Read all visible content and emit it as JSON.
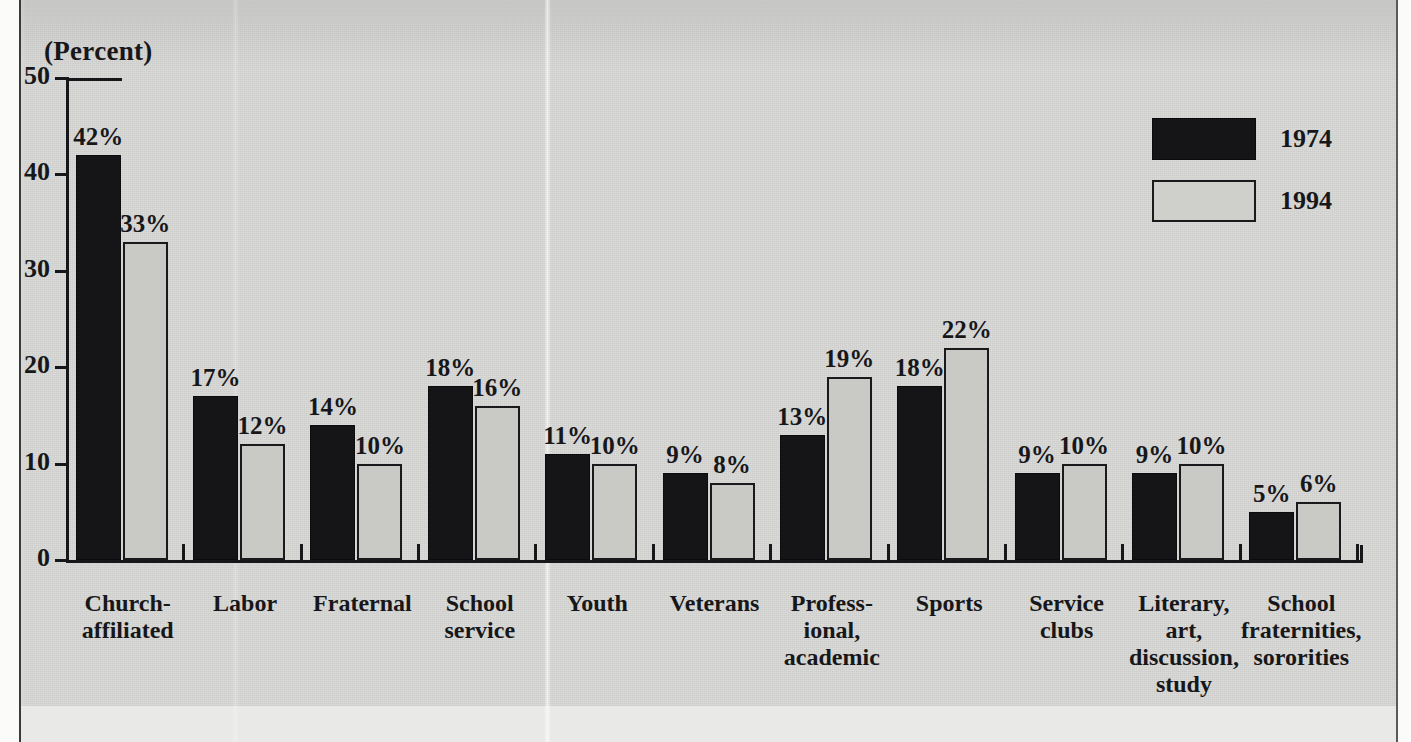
{
  "figure": {
    "axis_unit_label": "(Percent)",
    "cut_off_top_title": "",
    "left_frame_color": "#3a3a3a",
    "background_color": "#d9d9d7"
  },
  "legend": {
    "position": "top-right",
    "entries": [
      {
        "label": "1974",
        "swatch": "filled-black",
        "color": "#151517"
      },
      {
        "label": "1994",
        "swatch": "outlined-light",
        "color": "#c9c9c6"
      }
    ]
  },
  "axis": {
    "y_ticks": [
      "50",
      "40",
      "30",
      "20",
      "10",
      "0"
    ],
    "y_values": [
      50,
      40,
      30,
      20,
      10,
      0
    ]
  },
  "chart_data": {
    "type": "bar",
    "title": "(Percent)",
    "xlabel": "",
    "ylabel": "(Percent)",
    "ylim": [
      0,
      50
    ],
    "grid": false,
    "legend_position": "top-right",
    "categories": [
      "Church-\naffiliated",
      "Labor",
      "Fraternal",
      "School\nservice",
      "Youth",
      "Veterans",
      "Profess-\nional,\nacademic",
      "Sports",
      "Service\nclubs",
      "Literary,\nart,\ndiscussion,\nstudy",
      "School\nfraternities,\nsororities"
    ],
    "series": [
      {
        "name": "1974",
        "values": [
          42,
          17,
          14,
          18,
          11,
          9,
          13,
          18,
          9,
          9,
          5
        ]
      },
      {
        "name": "1994",
        "values": [
          33,
          12,
          10,
          16,
          10,
          8,
          19,
          22,
          10,
          10,
          6
        ]
      }
    ],
    "data_labels": {
      "1974": [
        "42%",
        "17%",
        "14%",
        "18%",
        "11%",
        "9%",
        "13%",
        "18%",
        "9%",
        "9%",
        "5%"
      ],
      "1994": [
        "33%",
        "12%",
        "10%",
        "16%",
        "10%",
        "8%",
        "19%",
        "22%",
        "10%",
        "10%",
        "6%"
      ]
    }
  }
}
